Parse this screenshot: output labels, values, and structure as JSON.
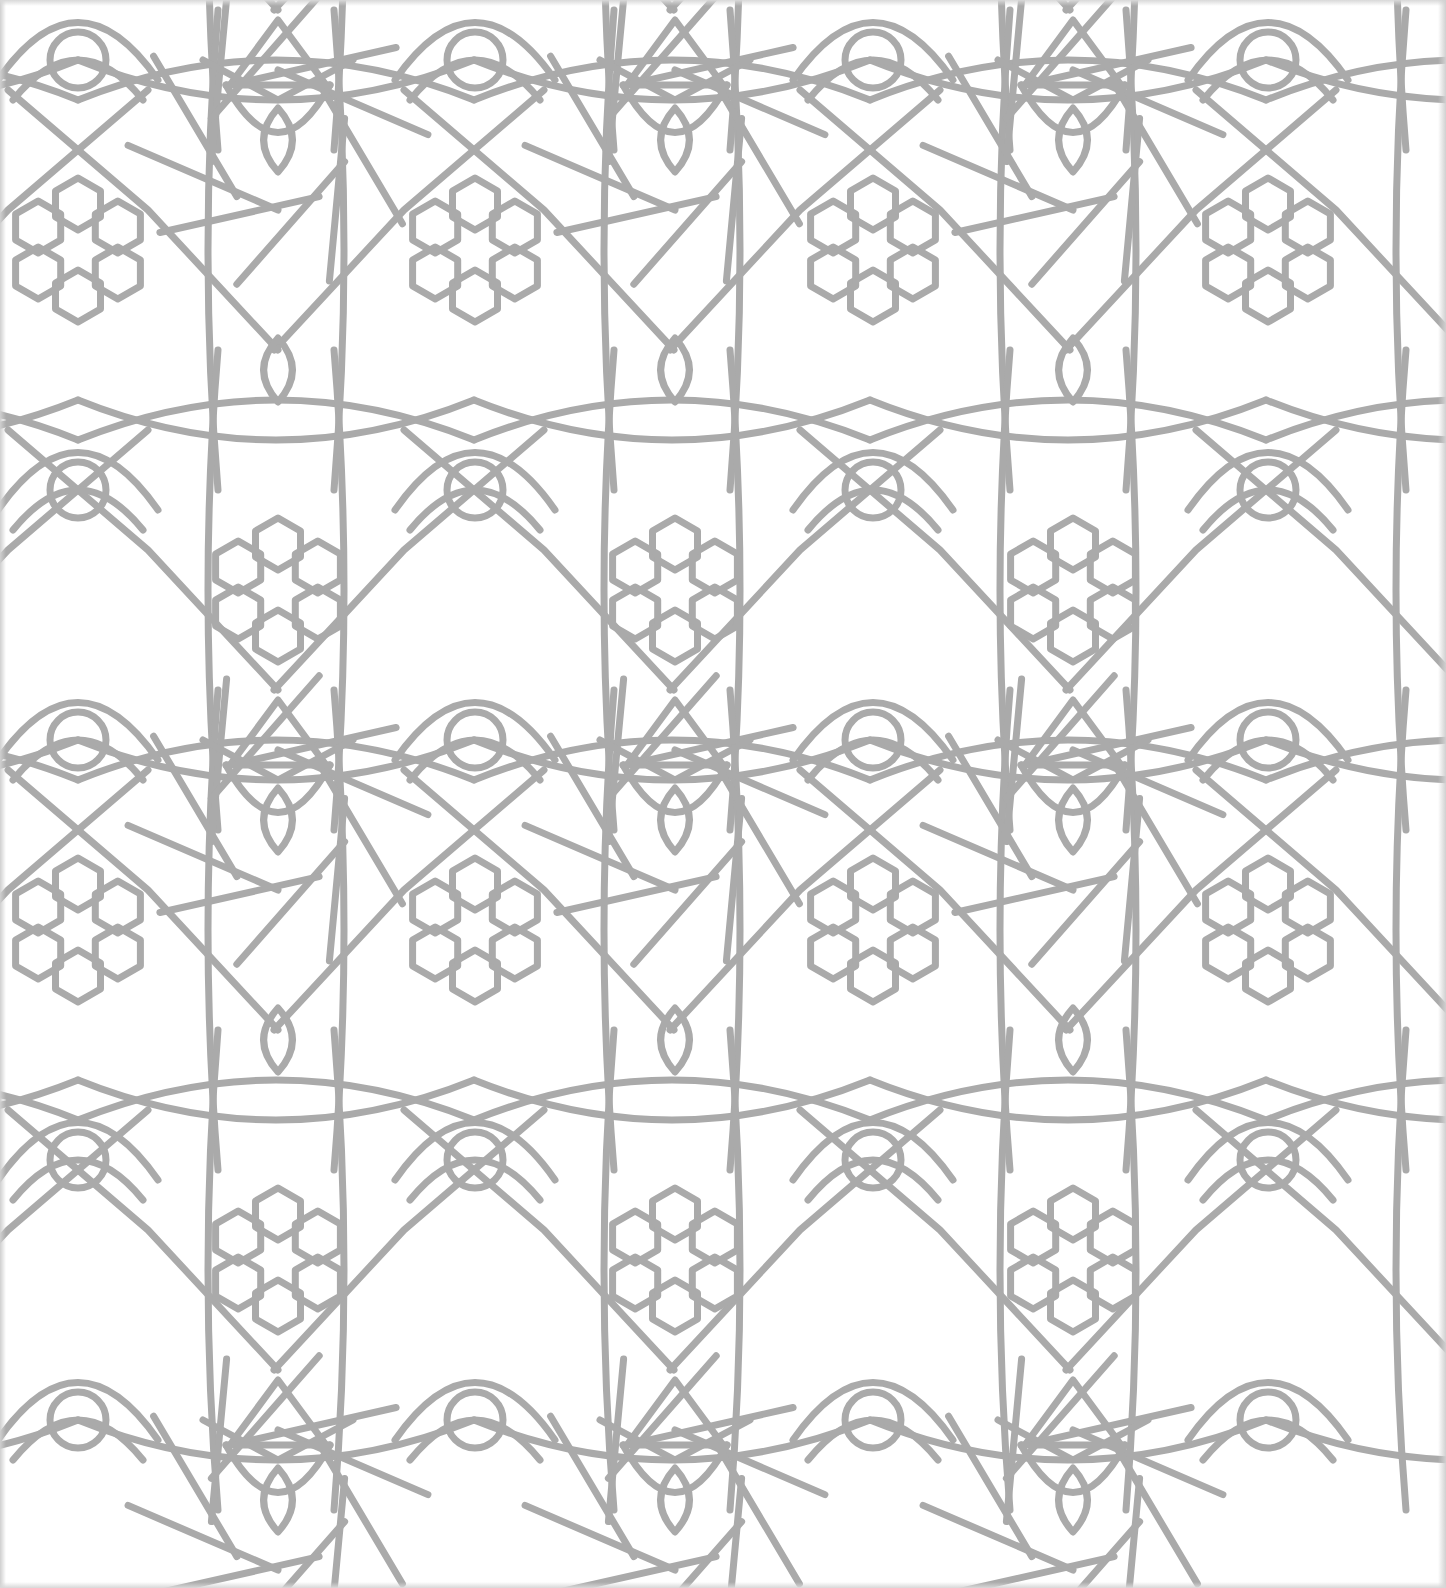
{
  "image": {
    "kind": "geometric-tile-pattern",
    "description": "Seamless Islamic-style geometric lattice with six-hexagon rosettes, pointed-oval (vesica) motifs, and interlacing star strapwork",
    "background_color": "#ffffff",
    "line_color": "#aaaaaa",
    "line_width": 7,
    "width": 1446,
    "height": 1588
  },
  "tile": {
    "period_x": 396,
    "period_y": 680,
    "origin_x": 78,
    "origin_y": 250,
    "hex_radius": 26,
    "rosette_ring_radius": 46,
    "oval_offset_y": 170,
    "oval_rx": 18,
    "oval_ry": 32
  },
  "motifs": {
    "rosettes_primary": [
      {
        "x": 78,
        "y": 250
      },
      {
        "x": 475,
        "y": 250
      },
      {
        "x": 873,
        "y": 250
      },
      {
        "x": 1268,
        "y": 250
      },
      {
        "x": 78,
        "y": 930
      },
      {
        "x": 475,
        "y": 930
      },
      {
        "x": 873,
        "y": 930
      },
      {
        "x": 1268,
        "y": 930
      }
    ],
    "rosettes_secondary": [
      {
        "x": 278,
        "y": 590
      },
      {
        "x": 675,
        "y": 590
      },
      {
        "x": 1073,
        "y": 590
      },
      {
        "x": 278,
        "y": 1260
      },
      {
        "x": 675,
        "y": 1260
      },
      {
        "x": 1073,
        "y": 1260
      }
    ]
  }
}
